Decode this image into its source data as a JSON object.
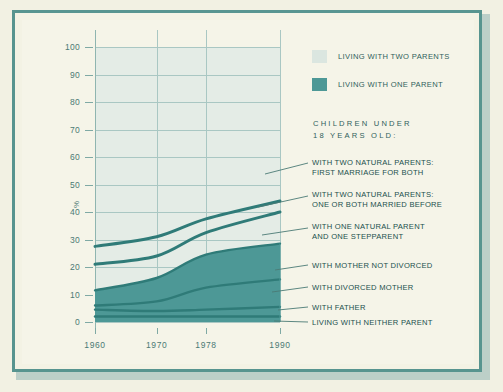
{
  "axes": {
    "y_label": "%",
    "y_ticks": [
      0,
      10,
      20,
      30,
      40,
      50,
      60,
      70,
      80,
      90,
      100
    ],
    "x_ticks": [
      "1960",
      "1970",
      "1978",
      "1990"
    ]
  },
  "legend": {
    "items": [
      {
        "label": "LIVING WITH TWO PARENTS",
        "color": "#dbe6e0",
        "swatch": "legend-swatch-two-parents"
      },
      {
        "label": "LIVING WITH ONE PARENT",
        "color": "#4d9896",
        "swatch": "legend-swatch-one-parent"
      }
    ]
  },
  "heading": {
    "line1": "CHILDREN UNDER",
    "line2": "18 YEARS OLD:"
  },
  "callouts": [
    {
      "id": "two-natural-first-marriage",
      "line1": "WITH TWO NATURAL PARENTS:",
      "line2": "FIRST MARRIAGE FOR BOTH"
    },
    {
      "id": "two-natural-remarried",
      "line1": "WITH TWO NATURAL PARENTS:",
      "line2": "ONE OR BOTH MARRIED BEFORE"
    },
    {
      "id": "one-natural-stepparent",
      "line1": "WITH ONE NATURAL PARENT",
      "line2": "AND ONE STEPPARENT"
    },
    {
      "id": "mother-not-divorced",
      "line1": "WITH MOTHER NOT DIVORCED",
      "line2": ""
    },
    {
      "id": "divorced-mother",
      "line1": "WITH DIVORCED MOTHER",
      "line2": ""
    },
    {
      "id": "with-father",
      "line1": "WITH FATHER",
      "line2": ""
    },
    {
      "id": "neither-parent",
      "line1": "LIVING WITH NEITHER PARENT",
      "line2": ""
    }
  ],
  "colors": {
    "background": "#f3f2e4",
    "frame": "#57948f",
    "plot_light": "#e4ece6",
    "teal_fill": "#4d9896",
    "band_line": "#2f7b78",
    "grid": "#a9c7c3",
    "text": "#2f5f5c"
  },
  "chart_data": {
    "type": "area",
    "title": "",
    "subtitle": "CHILDREN UNDER 18 YEARS OLD:",
    "xlabel": "",
    "ylabel": "%",
    "x": [
      1960,
      1970,
      1978,
      1990
    ],
    "xtick_labels": [
      "1960",
      "1970",
      "1978",
      "1990"
    ],
    "ylim": [
      0,
      100
    ],
    "ytick_labels": [
      0,
      10,
      20,
      30,
      40,
      50,
      60,
      70,
      80,
      90,
      100
    ],
    "grid": true,
    "legend_position": "top-right",
    "stacked": true,
    "note": "Cumulative stacked values read off the axis; each series value is the increment of its band.",
    "series": [
      {
        "name": "LIVING WITH NEITHER PARENT",
        "group": "neither",
        "values": [
          2.0,
          2.0,
          2.0,
          2.0
        ],
        "cumulative": [
          2.0,
          2.0,
          2.0,
          2.0
        ]
      },
      {
        "name": "WITH FATHER",
        "group": "one parent",
        "values": [
          2.5,
          2.0,
          2.5,
          3.5
        ],
        "cumulative": [
          4.5,
          4.0,
          4.5,
          5.5
        ]
      },
      {
        "name": "WITH DIVORCED MOTHER",
        "group": "one parent",
        "values": [
          1.5,
          3.5,
          8.0,
          10.0
        ],
        "cumulative": [
          6.0,
          7.5,
          12.5,
          15.5
        ]
      },
      {
        "name": "WITH MOTHER NOT DIVORCED",
        "group": "one parent",
        "values": [
          5.5,
          8.5,
          12.0,
          13.0
        ],
        "cumulative": [
          11.5,
          16.0,
          24.5,
          28.5
        ]
      },
      {
        "name": "WITH ONE NATURAL PARENT AND ONE STEPPARENT",
        "group": "two parents",
        "values": [
          9.5,
          8.0,
          8.0,
          11.5
        ],
        "cumulative": [
          21.0,
          24.0,
          32.5,
          40.0
        ]
      },
      {
        "name": "WITH TWO NATURAL PARENTS: ONE OR BOTH MARRIED BEFORE",
        "group": "two parents",
        "values": [
          6.5,
          7.0,
          5.0,
          4.0
        ],
        "cumulative": [
          27.5,
          31.0,
          37.5,
          44.0
        ]
      },
      {
        "name": "WITH TWO NATURAL PARENTS: FIRST MARRIAGE FOR BOTH",
        "group": "two parents",
        "values": [
          72.5,
          69.0,
          62.5,
          56.0
        ],
        "cumulative": [
          100,
          100,
          100,
          100
        ]
      }
    ]
  }
}
